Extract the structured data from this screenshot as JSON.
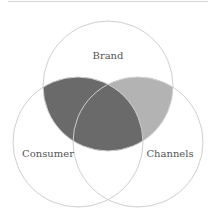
{
  "diagram": {
    "type": "venn",
    "sets": [
      {
        "label": "Brand",
        "cx": 108,
        "cy": 86,
        "r": 65
      },
      {
        "label": "Consumer",
        "cx": 78,
        "cy": 142,
        "r": 65
      },
      {
        "label": "Channels",
        "cx": 138,
        "cy": 142,
        "r": 65
      }
    ],
    "highlights": [
      {
        "region": "Brand ∩ Consumer",
        "color": "#6a6a6a"
      },
      {
        "region": "Brand ∩ Channels",
        "color": "#b3b3b3"
      }
    ],
    "stroke_color": "#cfcfcf"
  }
}
